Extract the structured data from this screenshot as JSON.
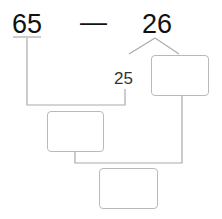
{
  "problem": {
    "minuend": "65",
    "operator": "—",
    "subtrahend": "26",
    "split_part": "25",
    "answer_boxes": [
      {
        "value": ""
      },
      {
        "value": ""
      },
      {
        "value": ""
      }
    ]
  }
}
